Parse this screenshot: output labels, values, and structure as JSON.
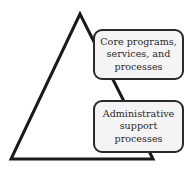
{
  "diagram": {
    "type": "pyramid",
    "colors": {
      "stroke": "#1a1a1a",
      "box_fill": "#f4f4f4",
      "text": "#2a2a2a"
    },
    "triangle": {
      "apex": [
        80,
        14
      ],
      "base_left": [
        11,
        159
      ],
      "base_right": [
        153,
        159
      ]
    },
    "boxes": [
      {
        "id": "core",
        "lines": [
          "Core programs,",
          "services, and",
          "processes"
        ]
      },
      {
        "id": "admin",
        "lines": [
          "Administrative",
          "support",
          "processes"
        ]
      }
    ]
  }
}
